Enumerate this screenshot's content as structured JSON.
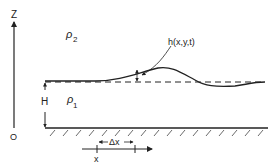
{
  "diagram": {
    "labels": {
      "z_axis": "Z",
      "origin": "O",
      "upper_density": "ρ",
      "upper_density_sub": "2",
      "lower_density": "ρ",
      "lower_density_sub": "1",
      "depth": "H",
      "displacement": "h(x,y,t)",
      "delta_x": "Δx",
      "x_pos": "x"
    },
    "colors": {
      "ink": "#222222",
      "background": "#ffffff"
    }
  }
}
